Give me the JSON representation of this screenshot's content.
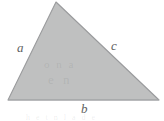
{
  "figure": {
    "kind": "geometry-diagram",
    "shape": "triangle",
    "caption": "",
    "background_color": "#ffffff",
    "fill_color": "#bfc0c0",
    "stroke_color": "#9a9b9d",
    "label_color": "#5e5f61",
    "canvas": {
      "width": 164,
      "height": 121
    },
    "vertices": [
      {
        "name": "apex",
        "x": 56,
        "y": 2
      },
      {
        "name": "bottom-right",
        "x": 159,
        "y": 100
      },
      {
        "name": "bottom-left",
        "x": 8,
        "y": 100
      }
    ],
    "labels": [
      {
        "id": "side-a",
        "text": "a",
        "side": "left",
        "x": 17,
        "y": 41
      },
      {
        "id": "side-c",
        "text": "c",
        "side": "right",
        "x": 111,
        "y": 39
      },
      {
        "id": "side-b",
        "text": "b",
        "side": "bottom",
        "x": 81,
        "y": 102
      }
    ],
    "artifacts": {
      "interior_ghost_1": "o n a",
      "interior_ghost_2": "e n",
      "bottom_strip_ghost": "h e   t  n l   a d e"
    }
  }
}
